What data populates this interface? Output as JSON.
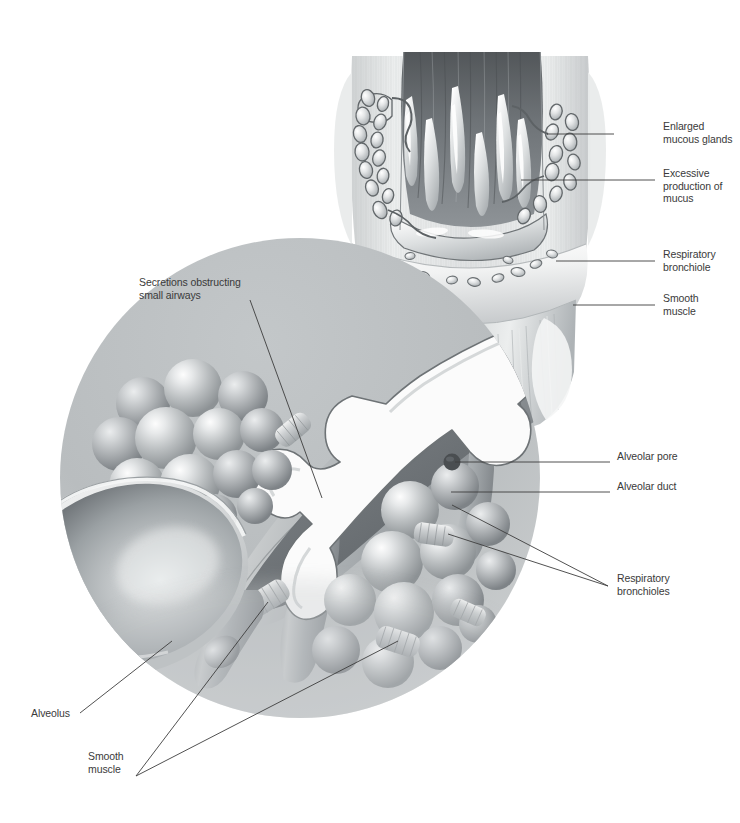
{
  "figure": {
    "background_color": "#ffffff",
    "text_color": "#3a3a3a",
    "leader_color": "#3d3d3d",
    "width": 740,
    "height": 823
  },
  "labels": [
    {
      "id": "enlarged-mucous-glands",
      "text": "Enlarged\nmucous glands",
      "align": "left",
      "x": 663,
      "y": 126,
      "leader": {
        "x1": 614,
        "y1": 134,
        "x2": 547,
        "y2": 134
      }
    },
    {
      "id": "excessive-production-of-mucus",
      "text": "Excessive\nproduction of mucus",
      "align": "left",
      "x": 663,
      "y": 173,
      "leader": {
        "x1": 655,
        "y1": 180,
        "x2": 521,
        "y2": 180
      }
    },
    {
      "id": "respiratory-bronchiole",
      "text": "Respiratory\nbronchiole",
      "align": "left",
      "x": 663,
      "y": 254,
      "leader": {
        "x1": 655,
        "y1": 261,
        "x2": 556,
        "y2": 261
      }
    },
    {
      "id": "smooth-muscle-upper",
      "text": "Smooth\nmuscle",
      "align": "left",
      "x": 663,
      "y": 298,
      "leader": {
        "x1": 655,
        "y1": 305,
        "x2": 573,
        "y2": 305
      }
    },
    {
      "id": "alveolar-pore",
      "text": "Alveolar pore",
      "align": "left",
      "x": 617,
      "y": 456,
      "leader": {
        "x1": 610,
        "y1": 462,
        "x2": 455,
        "y2": 462
      }
    },
    {
      "id": "alveolar-duct",
      "text": "Alveolar duct",
      "align": "left",
      "x": 617,
      "y": 486,
      "leader": {
        "x1": 610,
        "y1": 492,
        "x2": 451,
        "y2": 492
      }
    },
    {
      "id": "respiratory-bronchioles",
      "text": "Respiratory\nbronchioles",
      "align": "left",
      "x": 617,
      "y": 578,
      "leader_multi": [
        {
          "x1": 608,
          "y1": 586,
          "x2": 452,
          "y2": 505
        },
        {
          "x1": 608,
          "y1": 586,
          "x2": 448,
          "y2": 534
        }
      ]
    },
    {
      "id": "secretions-obstructing-small-airways",
      "text": "Secretions obstructing\nsmall airways",
      "align": "left",
      "x": 139,
      "y": 282,
      "leader": {
        "x1": 250,
        "y1": 300,
        "x2": 322,
        "y2": 498
      }
    },
    {
      "id": "alveolus",
      "text": "Alveolus",
      "align": "left",
      "x": 31,
      "y": 713,
      "leader": {
        "x1": 80,
        "y1": 713,
        "x2": 172,
        "y2": 641
      }
    },
    {
      "id": "smooth-muscle-lower",
      "text": "Smooth\nmuscle",
      "align": "left",
      "x": 88,
      "y": 756,
      "leader_multi": [
        {
          "x1": 136,
          "y1": 776,
          "x2": 268,
          "y2": 602
        },
        {
          "x1": 136,
          "y1": 776,
          "x2": 398,
          "y2": 641
        }
      ]
    }
  ],
  "scene": {
    "bronchus": {
      "name": "cut-away bronchus with hypertrophied mucous glands",
      "lumen_color": "#6f7478",
      "wall_color": "#d9dcdd"
    },
    "magnified_circle": {
      "name": "magnified alveolar region",
      "center_x": 300,
      "center_y": 478,
      "radius": 240,
      "fill_top": "#b9bdbf",
      "fill_bottom": "#d9dcdd"
    },
    "mucus_color": "#fbfbfb",
    "alveoli_color": "#b3b7b9"
  }
}
